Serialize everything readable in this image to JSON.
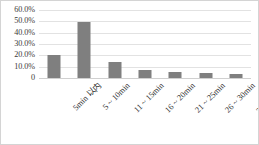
{
  "chart_data": {
    "type": "bar",
    "title": "",
    "subtitle": "",
    "xlabel": "",
    "ylabel": "",
    "categories": [
      "5min 以内",
      "5 ~ 10min",
      "11 ~ 15min",
      "16 ~ 20min",
      "21 ~ 25min",
      "26 ~ 30min",
      "30min 以上"
    ],
    "values": [
      20.0,
      49.0,
      14.5,
      7.5,
      5.5,
      4.0,
      3.5
    ],
    "value_unit": "%",
    "ylim": [
      0,
      60
    ],
    "y_tick_values": [
      60,
      50,
      40,
      30,
      20,
      10,
      0
    ],
    "y_tick_labels": [
      "60.0%",
      "50.0%",
      "40.0%",
      "30.0%",
      "20.0%",
      "10.0%",
      "0"
    ],
    "grid": "horizontal",
    "legend": "none",
    "bar_color": "#7f7f7f",
    "gridline_color": "#e2e2e2",
    "border_color": "#d4d4d4",
    "x_tick_rotation": -45
  }
}
